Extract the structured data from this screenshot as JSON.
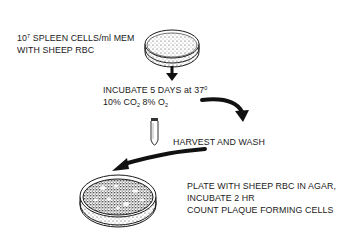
{
  "diagram": {
    "type": "procedure-flow",
    "steps": [
      {
        "id": "step-1",
        "lines": [
          {
            "base": "10",
            "sup": "7",
            "rest": " SPLEEN CELLS/ml MEM"
          },
          {
            "text": "WITH SHEEP RBC"
          }
        ],
        "icon": "petri-dish-icon"
      },
      {
        "id": "step-2",
        "lines": [
          {
            "text": "INCUBATE 5 DAYS at 37",
            "sup": "0"
          },
          {
            "a": "10% CO",
            "a_sub": "2",
            "b": " 8%  O",
            "b_sub": "2"
          }
        ]
      },
      {
        "id": "step-3",
        "lines": [
          {
            "text": "HARVEST AND WASH"
          }
        ],
        "icon": "test-tube-icon"
      },
      {
        "id": "step-4",
        "lines": [
          {
            "text": "PLATE WITH SHEEP RBC IN AGAR,"
          },
          {
            "text": "INCUBATE 2 HR"
          },
          {
            "text": "COUNT PLAQUE FORMING CELLS"
          }
        ],
        "icon": "agar-plate-icon"
      }
    ],
    "arrows": [
      "down-arrow",
      "curved-arrow-right",
      "curved-arrow-left"
    ],
    "colors": {
      "ink": "#1a1a1a",
      "background": "#ffffff"
    }
  }
}
